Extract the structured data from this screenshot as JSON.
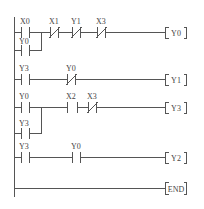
{
  "diagram": {
    "type": "PLC ladder diagram",
    "rungs": [
      {
        "id": 1,
        "contacts": [
          {
            "label": "X0",
            "type": "NO"
          },
          {
            "label": "X1",
            "type": "NC"
          },
          {
            "label": "Y1",
            "type": "NC"
          },
          {
            "label": "X3",
            "type": "NC"
          }
        ],
        "parallel": [
          {
            "label": "Y0",
            "type": "NO",
            "across": "X0"
          }
        ],
        "coil": "Y0"
      },
      {
        "id": 2,
        "contacts": [
          {
            "label": "Y3",
            "type": "NO"
          },
          {
            "label": "Y0",
            "type": "NC"
          }
        ],
        "coil": "Y1"
      },
      {
        "id": 3,
        "contacts": [
          {
            "label": "Y0",
            "type": "NO"
          },
          {
            "label": "X2",
            "type": "NO"
          },
          {
            "label": "X3",
            "type": "NC"
          }
        ],
        "parallel": [
          {
            "label": "Y3",
            "type": "NO",
            "across": "Y0"
          }
        ],
        "coil": "Y3"
      },
      {
        "id": 4,
        "contacts": [
          {
            "label": "Y3",
            "type": "NO"
          },
          {
            "label": "Y0",
            "type": "NO"
          }
        ],
        "coil": "Y2"
      },
      {
        "id": 5,
        "contacts": [],
        "coil": "END"
      }
    ]
  },
  "labels": {
    "r1_c1": "X0",
    "r1_c2": "X1",
    "r1_c3": "Y1",
    "r1_c4": "X3",
    "r1_p1": "Y0",
    "r1_coil": "Y0",
    "r2_c1": "Y3",
    "r2_c2": "Y0",
    "r2_coil": "Y1",
    "r3_c1": "Y0",
    "r3_c2": "X2",
    "r3_c3": "X3",
    "r3_p1": "Y3",
    "r3_coil": "Y3",
    "r4_c1": "Y3",
    "r4_c2": "Y0",
    "r4_coil": "Y2",
    "r5_coil": "END"
  }
}
